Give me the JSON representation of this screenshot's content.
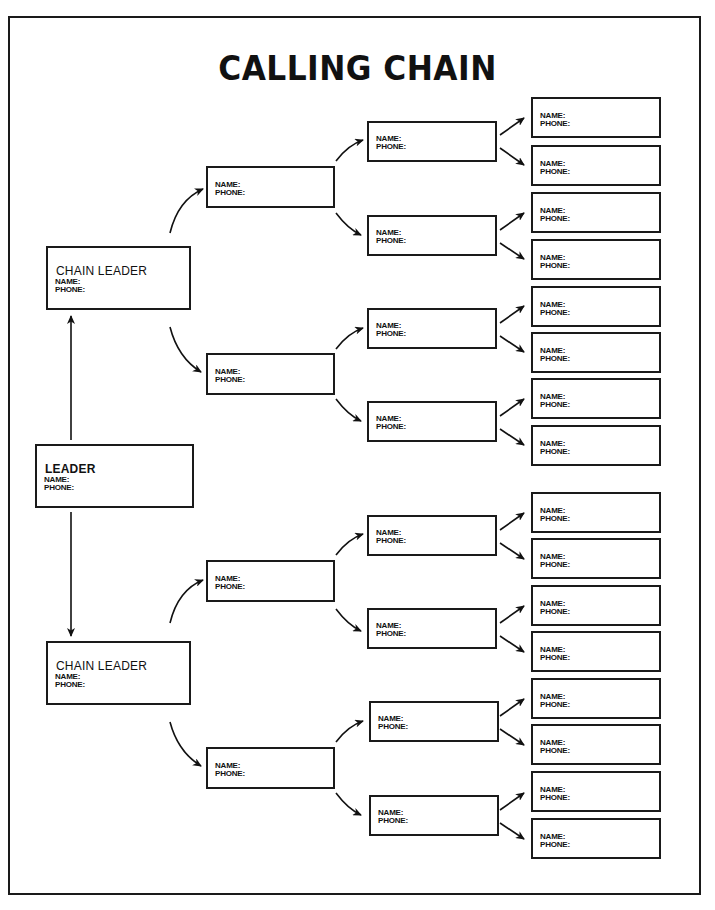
{
  "title": "CALLING CHAIN",
  "labels": {
    "name": "NAME:",
    "phone": "PHONE:"
  },
  "leader": {
    "role": "LEADER"
  },
  "chain_leaders": [
    {
      "role": "CHAIN LEADER"
    },
    {
      "role": "CHAIN LEADER"
    }
  ],
  "callers_level1_count": 4,
  "callers_level2_count": 8,
  "callers_level3_count": 16
}
